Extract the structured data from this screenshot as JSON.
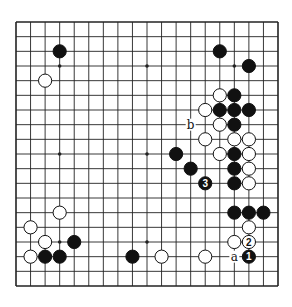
{
  "diagram": {
    "type": "go-board",
    "size": 19,
    "colors": {
      "background": "#ffffff",
      "line": "#222222",
      "black_stone": "#111111",
      "white_stone": "#ffffff",
      "stone_outline": "#111111"
    },
    "star_points": [
      [
        3,
        3
      ],
      [
        9,
        3
      ],
      [
        15,
        3
      ],
      [
        3,
        9
      ],
      [
        9,
        9
      ],
      [
        15,
        9
      ],
      [
        3,
        15
      ],
      [
        9,
        15
      ],
      [
        15,
        15
      ]
    ],
    "black_stones": [
      [
        3,
        2
      ],
      [
        14,
        2
      ],
      [
        16,
        3
      ],
      [
        15,
        5
      ],
      [
        14,
        6
      ],
      [
        15,
        6
      ],
      [
        16,
        6
      ],
      [
        15,
        7
      ],
      [
        11,
        9
      ],
      [
        15,
        9
      ],
      [
        12,
        10
      ],
      [
        15,
        10
      ],
      [
        15,
        11
      ],
      [
        15,
        13
      ],
      [
        16,
        13
      ],
      [
        17,
        13
      ],
      [
        4,
        15
      ],
      [
        2,
        16
      ],
      [
        3,
        16
      ],
      [
        8,
        16
      ]
    ],
    "white_stones": [
      [
        2,
        4
      ],
      [
        14,
        5
      ],
      [
        13,
        6
      ],
      [
        14,
        7
      ],
      [
        13,
        8
      ],
      [
        15,
        8
      ],
      [
        16,
        8
      ],
      [
        14,
        9
      ],
      [
        16,
        9
      ],
      [
        16,
        10
      ],
      [
        16,
        11
      ],
      [
        3,
        13
      ],
      [
        1,
        14
      ],
      [
        16,
        14
      ],
      [
        2,
        15
      ],
      [
        15,
        15
      ],
      [
        1,
        16
      ],
      [
        10,
        16
      ],
      [
        13,
        16
      ]
    ],
    "numbered_stones": [
      {
        "number": "1",
        "color": "black",
        "col": 16,
        "row": 16
      },
      {
        "number": "2",
        "color": "white",
        "col": 16,
        "row": 15
      },
      {
        "number": "3",
        "color": "black",
        "col": 13,
        "row": 11
      }
    ],
    "labels": [
      {
        "text": "a",
        "col": 15,
        "row": 16
      },
      {
        "text": "b",
        "col": 12,
        "row": 7
      }
    ]
  }
}
